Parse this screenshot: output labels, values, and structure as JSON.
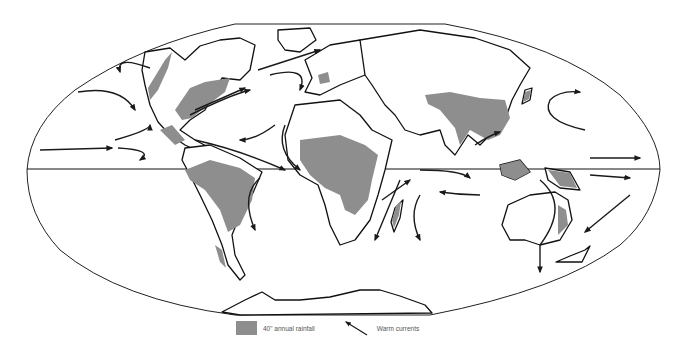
{
  "map": {
    "projection": "elliptical world map",
    "colors": {
      "rainfall_fill": "#8e8e8e",
      "land_fill": "#ffffff",
      "outline": "#111111",
      "background": "#ffffff"
    },
    "features": [
      "equator-line",
      "continents",
      "rainfall-regions",
      "warm-current-arrows"
    ]
  },
  "legend": {
    "items": [
      {
        "symbol": "grey-swatch",
        "label": "40\" annual rainfall"
      },
      {
        "symbol": "arrow",
        "label": "Warm currents"
      }
    ]
  }
}
